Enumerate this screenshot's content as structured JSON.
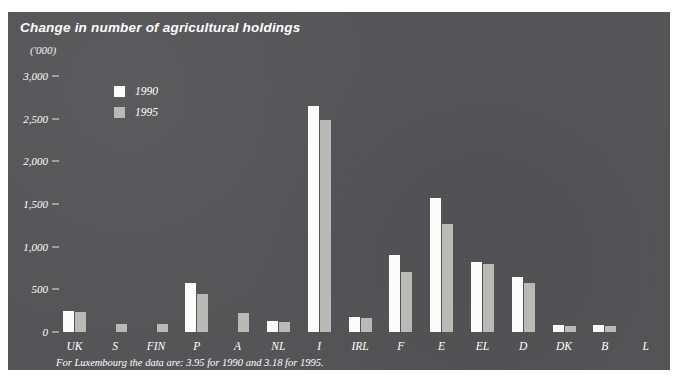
{
  "figure": {
    "title": "Change in number of agricultural holdings",
    "unit_label": "('000)",
    "footnote": "For Luxembourg the data are: 3.95 for 1990 and 3.18 for 1995.",
    "panel_color": "#555558",
    "page_background": "#ffffff"
  },
  "legend": {
    "position": "inside-top-left",
    "entries": [
      {
        "label": "1990",
        "color": "#fcfcfa",
        "swatch_name": "legend-swatch-1990"
      },
      {
        "label": "1995",
        "color": "#b9b9b5",
        "swatch_name": "legend-swatch-1995"
      }
    ]
  },
  "chart_data": {
    "type": "bar",
    "title": "Change in number of agricultural holdings",
    "subtitle": "",
    "xlabel": "",
    "ylabel": "('000)",
    "ylim": [
      0,
      3000
    ],
    "yticks": [
      0,
      500,
      1000,
      1500,
      2000,
      2500,
      3000
    ],
    "ytick_labels": [
      "0",
      "500",
      "1,000",
      "1,500",
      "2,000",
      "2,500",
      "3,000"
    ],
    "grid": false,
    "categories": [
      "UK",
      "S",
      "FIN",
      "P",
      "A",
      "NL",
      "I",
      "IRL",
      "F",
      "E",
      "EL",
      "D",
      "DK",
      "B",
      "L"
    ],
    "series": [
      {
        "name": "1990",
        "color": "#fcfcfa",
        "values": [
          242,
          null,
          null,
          580,
          null,
          125,
          2650,
          170,
          900,
          1570,
          820,
          650,
          80,
          85,
          3.95
        ]
      },
      {
        "name": "1995",
        "color": "#b9b9b5",
        "values": [
          240,
          90,
          90,
          450,
          220,
          115,
          2490,
          160,
          700,
          1270,
          800,
          570,
          70,
          75,
          3.18
        ]
      }
    ],
    "annotations": [
      "For Luxembourg the data are: 3.95 for 1990 and 3.18 for 1995."
    ]
  }
}
